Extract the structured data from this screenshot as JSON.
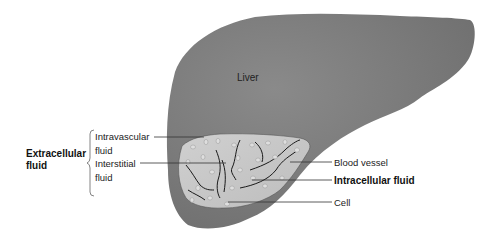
{
  "diagram": {
    "organ_label": "Liver",
    "group_label_line1": "Extracellular",
    "group_label_line2": "fluid",
    "left_labels": [
      {
        "line1": "Intravascular",
        "line2": "fluid"
      },
      {
        "line1": "Interstitial",
        "line2": "fluid"
      }
    ],
    "right_labels": [
      {
        "text": "Blood vessel",
        "bold": false
      },
      {
        "text": "Intracellular fluid",
        "bold": true
      },
      {
        "text": "Cell",
        "bold": false
      }
    ],
    "colors": {
      "liver": "#777777",
      "tissue": "#c4c4c4",
      "vessel": "#1a1a1a",
      "cell": "#dedede",
      "leader": "#333333"
    }
  }
}
